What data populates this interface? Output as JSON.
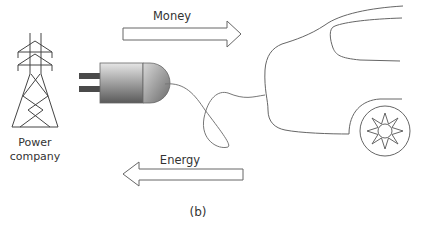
{
  "diagram": {
    "caption": "(b)",
    "nodes": [
      {
        "id": "power-company",
        "label_line1": "Power",
        "label_line2": "company",
        "icon": "transmission-tower-icon"
      },
      {
        "id": "plug",
        "icon": "electric-plug-icon"
      },
      {
        "id": "car",
        "icon": "car-outline-icon"
      }
    ],
    "edges": [
      {
        "from": "power-company",
        "to": "car",
        "label": "Money",
        "direction": "right"
      },
      {
        "from": "car",
        "to": "power-company",
        "label": "Energy",
        "direction": "left"
      }
    ]
  },
  "colors": {
    "line": "#555555",
    "arrow_stroke": "#666666",
    "text": "#333333",
    "plug_dark": "#4a4a4a",
    "plug_light": "#e0e0e0"
  }
}
